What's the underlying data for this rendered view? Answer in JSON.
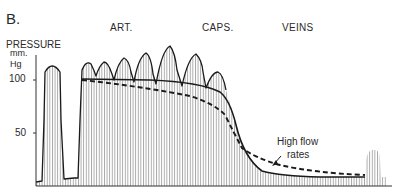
{
  "figure": {
    "panel_label": "B.",
    "regions": [
      "ART.",
      "CAPS.",
      "VEINS"
    ],
    "y_axis": {
      "title_line1": "PRESSURE",
      "title_line2": "mm.",
      "title_line3": "Hg",
      "ticks": [
        "100",
        "50"
      ]
    },
    "annotation": {
      "line1": "High flow",
      "line2": "rates"
    },
    "colors": {
      "line": "#1a1a1a",
      "hatch": "#8a8a8a",
      "background": "#ffffff"
    }
  }
}
